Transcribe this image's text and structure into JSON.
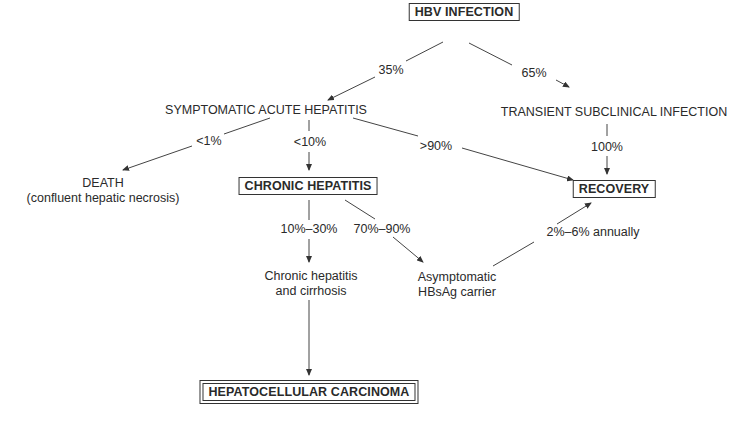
{
  "diagram": {
    "nodes": {
      "hbv_infection": "HBV INFECTION",
      "symptomatic_acute": "SYMPTOMATIC ACUTE HEPATITIS",
      "transient_subclinical": "TRANSIENT SUBCLINICAL INFECTION",
      "death": "DEATH",
      "death_sub": "(confluent hepatic necrosis)",
      "chronic_hepatitis": "CHRONIC HEPATITIS",
      "recovery": "RECOVERY",
      "chronic_cirrhosis_line1": "Chronic hepatitis",
      "chronic_cirrhosis_line2": "and cirrhosis",
      "carrier_line1": "Asymptomatic",
      "carrier_line2": "HBsAg carrier",
      "hcc": "HEPATOCELLULAR CARCINOMA"
    },
    "edges": {
      "hbv_to_symptomatic": "35%",
      "hbv_to_transient": "65%",
      "symptomatic_to_death": "<1%",
      "symptomatic_to_chronic": "<10%",
      "symptomatic_to_recovery": ">90%",
      "transient_to_recovery": "100%",
      "chronic_to_cirrhosis": "10%–30%",
      "chronic_to_carrier": "70%–90%",
      "carrier_to_recovery": "2%–6% annually"
    },
    "colors": {
      "line": "#333333",
      "text": "#2a2a2a",
      "background": "#ffffff"
    }
  }
}
